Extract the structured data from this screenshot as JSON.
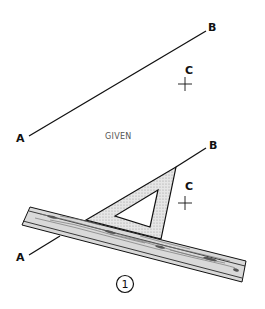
{
  "figure": {
    "given_panel": {
      "caption": "GIVEN",
      "point_a_label": "A",
      "point_b_label": "B",
      "point_c_label": "C"
    },
    "step_panel": {
      "point_a_label": "A",
      "point_b_label": "B",
      "point_c_label": "C",
      "step_number": "1",
      "tools": [
        "triangle",
        "straightedge"
      ]
    }
  }
}
